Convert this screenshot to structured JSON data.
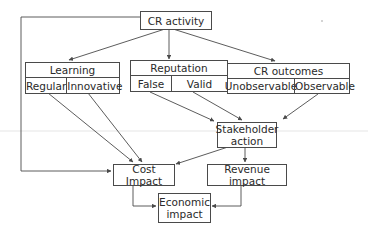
{
  "diagram": {
    "line_color": "#4a4a4a",
    "nodes": {
      "cr_activity": {
        "label": "CR activity"
      },
      "learning": {
        "label": "Learning",
        "options": [
          "Regular",
          "Innovative"
        ]
      },
      "reputation": {
        "label": "Reputation",
        "options": [
          "False",
          "Valid"
        ]
      },
      "cr_outcomes": {
        "label": "CR outcomes",
        "options": [
          "Unobservable",
          "Observable"
        ]
      },
      "stakeholder_action": {
        "label_line1": "Stakeholder",
        "label_line2": "action"
      },
      "cost_impact": {
        "label": "Cost Impact"
      },
      "revenue_impact": {
        "label": "Revenue impact"
      },
      "economic_impact": {
        "label_line1": "Economic",
        "label_line2": "impact"
      }
    },
    "edges": [
      {
        "from": "CR activity",
        "to": "Learning"
      },
      {
        "from": "CR activity",
        "to": "Reputation"
      },
      {
        "from": "CR activity",
        "to": "CR outcomes"
      },
      {
        "from": "CR activity",
        "to": "Cost Impact"
      },
      {
        "from": "Unobservable",
        "to": "Valid"
      },
      {
        "from": "Regular",
        "to": "Cost Impact"
      },
      {
        "from": "Innovative",
        "to": "Cost Impact"
      },
      {
        "from": "False",
        "to": "Stakeholder action"
      },
      {
        "from": "Valid",
        "to": "Stakeholder action"
      },
      {
        "from": "Observable",
        "to": "Stakeholder action"
      },
      {
        "from": "Stakeholder action",
        "to": "Cost Impact"
      },
      {
        "from": "Stakeholder action",
        "to": "Revenue impact"
      },
      {
        "from": "Cost Impact",
        "to": "Economic impact"
      },
      {
        "from": "Revenue impact",
        "to": "Economic impact"
      }
    ]
  }
}
